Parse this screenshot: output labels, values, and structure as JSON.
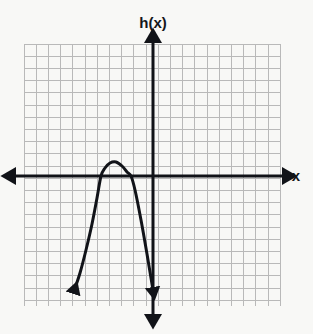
{
  "figure": {
    "title": "",
    "background_color": "#f8f8f6",
    "width": 313,
    "height": 334
  },
  "labels": {
    "y_axis_label": "h(x)",
    "x_axis_label": "x"
  },
  "grid": {
    "line_color": "#b9b9b9",
    "cell_size_px": 12.2,
    "left_px": 24,
    "top_px": 44,
    "right_px": 281,
    "bottom_px": 306,
    "columns": 21,
    "rows": 21,
    "visible": true
  },
  "axes": {
    "color": "#111318",
    "stroke_width": 3,
    "origin_px": {
      "x": 153,
      "y": 176
    },
    "x_axis": {
      "y_px": 176,
      "start_px": 10,
      "end_px": 288,
      "arrow_start": true,
      "arrow_end": true
    },
    "y_axis": {
      "x_px": 153,
      "start_px": 37,
      "end_px": 320,
      "arrow_start": true,
      "arrow_end": true
    }
  },
  "chart_data": {
    "type": "line",
    "title": "",
    "xlabel": "x",
    "ylabel": "h(x)",
    "grid": true,
    "legend": false,
    "curve_name": "h(x)",
    "curve_shape": "downward-opening parabola",
    "curve_color": "#111318",
    "curve_stroke_width": 3,
    "arrow_start": true,
    "arrow_end": true,
    "unit_px": 12.2,
    "vertex": {
      "x": -3.0,
      "y": 1.15
    },
    "x_intercepts": [
      -4.3,
      -1.8
    ],
    "xlim": [
      -10.6,
      10.6
    ],
    "ylim": [
      -10.6,
      10.8
    ],
    "x": [
      -6.5,
      -6.0,
      -5.5,
      -5.0,
      -4.5,
      -4.3,
      -4.0,
      -3.5,
      -3.0,
      -2.5,
      -2.0,
      -1.8,
      -1.5,
      -1.0,
      -0.5,
      0.0
    ],
    "y": [
      -10.4,
      -7.6,
      -5.2,
      -3.1,
      -1.3,
      -0.8,
      0.1,
      1.0,
      1.15,
      0.8,
      -0.2,
      -0.7,
      -1.8,
      -3.9,
      -6.4,
      -9.2
    ],
    "points_px": [
      {
        "x": 74,
        "y": 291
      },
      {
        "x": 80,
        "y": 273
      },
      {
        "x": 86,
        "y": 250
      },
      {
        "x": 92,
        "y": 224
      },
      {
        "x": 97,
        "y": 198
      },
      {
        "x": 101,
        "y": 176
      },
      {
        "x": 105,
        "y": 168
      },
      {
        "x": 110,
        "y": 163
      },
      {
        "x": 116,
        "y": 162
      },
      {
        "x": 122,
        "y": 166
      },
      {
        "x": 127,
        "y": 172
      },
      {
        "x": 131,
        "y": 176
      },
      {
        "x": 135,
        "y": 190
      },
      {
        "x": 141,
        "y": 220
      },
      {
        "x": 147,
        "y": 254
      },
      {
        "x": 153,
        "y": 290
      }
    ]
  }
}
